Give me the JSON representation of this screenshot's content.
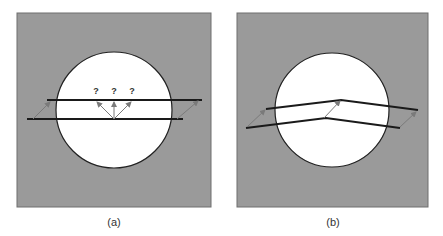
{
  "figure": {
    "colors": {
      "panel_fill": "#9a9a9a",
      "panel_border": "#6e6e6e",
      "circle_fill": "#ffffff",
      "circle_stroke": "#222222",
      "line_stroke": "#1a1a1a",
      "arrow_stroke": "#7a7a7a"
    },
    "panels": [
      {
        "id": "a",
        "caption": "(a)",
        "description": "Parallel strip crossing circle; displacement ambiguous inside aperture",
        "question_marks": [
          "?",
          "?",
          "?"
        ]
      },
      {
        "id": "b",
        "caption": "(b)",
        "description": "Bent strip crossing circle; displacement determined at the kink"
      }
    ]
  }
}
